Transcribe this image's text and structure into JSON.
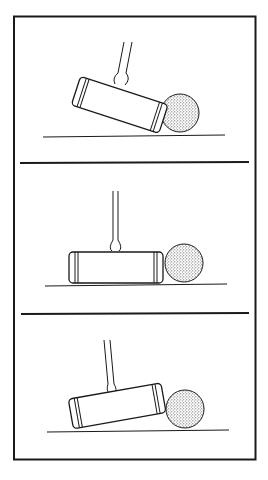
{
  "figure": {
    "panels": [
      {
        "id": "top",
        "mallet_angle": "tilted up toward ball (head raised at back)"
      },
      {
        "id": "middle",
        "mallet_angle": "level, flat on ground"
      },
      {
        "id": "bottom",
        "mallet_angle": "tilted down toward ball (head raised at front)"
      }
    ],
    "colors": {
      "line": "#1a1a1a",
      "background": "#ffffff",
      "ball_stipple": "#555555"
    }
  }
}
